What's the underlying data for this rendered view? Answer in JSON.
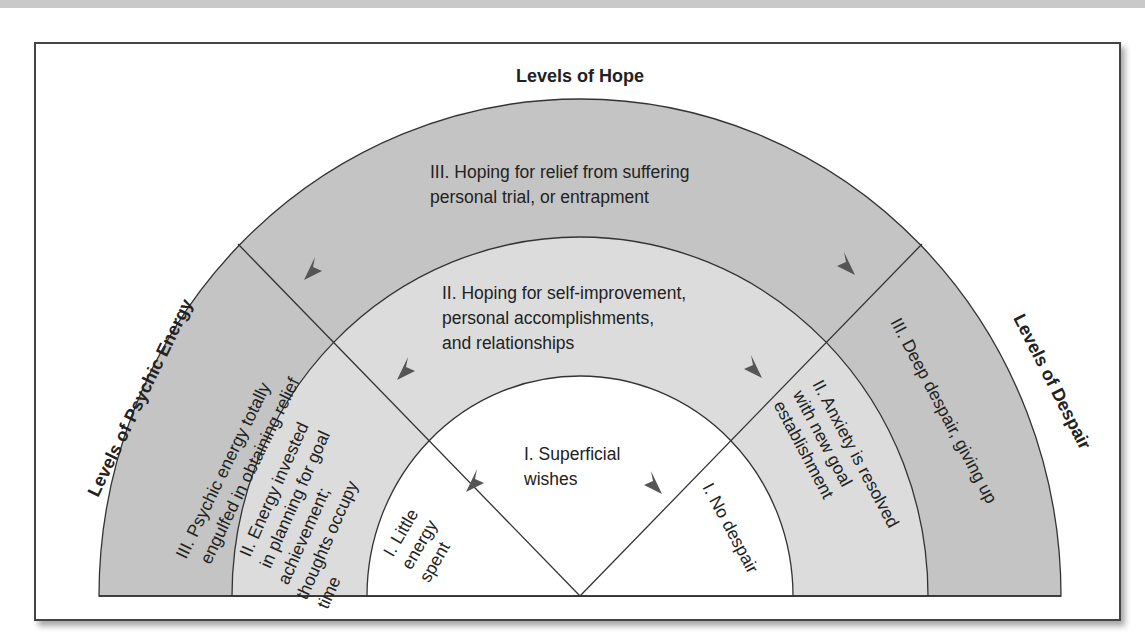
{
  "diagram": {
    "titles": {
      "hope": "Levels of Hope",
      "energy": "Levels of Psychic Energy",
      "despair": "Levels of Despair"
    },
    "hope_levels": {
      "level3": [
        "III. Hoping for relief from suffering",
        "personal trial, or entrapment"
      ],
      "level2": [
        "II. Hoping for self-improvement,",
        "personal accomplishments,",
        "and relationships"
      ],
      "level1": [
        "I. Superficial",
        "wishes"
      ]
    },
    "energy_levels": {
      "level3": [
        "III. Psychic energy totally",
        "engulfed in obtaining relief"
      ],
      "level2": [
        "II. Energy invested",
        "in planning for goal",
        "achievement;",
        "thoughts occupy",
        "time"
      ],
      "level1": [
        "I. Little",
        "energy",
        "spent"
      ]
    },
    "despair_levels": {
      "level3": [
        "III. Deep despair, giving up"
      ],
      "level2": [
        "II. Anxiety is resolved",
        "with new goal",
        "establishment"
      ],
      "level1": [
        "I. No despair"
      ]
    },
    "colors": {
      "outer_ring": "#c4c4c4",
      "middle_ring": "#dcdcdc",
      "inner": "#ffffff",
      "lines": "#333333",
      "arrows": "#555555"
    }
  }
}
